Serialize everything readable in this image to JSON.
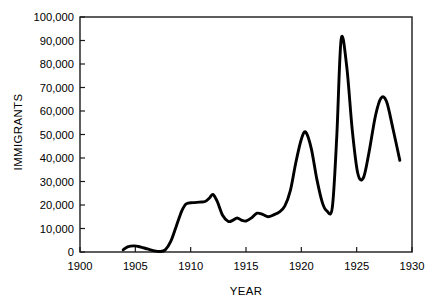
{
  "chart_data": {
    "type": "line",
    "title": "",
    "xlabel": "YEAR",
    "ylabel": "IMMIGRANTS",
    "xlim": [
      1900,
      1930
    ],
    "ylim": [
      0,
      100000
    ],
    "grid": false,
    "legend": "none",
    "x_ticks": [
      1900,
      1905,
      1910,
      1915,
      1920,
      1925,
      1930
    ],
    "x_tick_labels": [
      "1900",
      "1905",
      "1910",
      "1915",
      "1920",
      "1925",
      "1930"
    ],
    "y_ticks": [
      0,
      10000,
      20000,
      30000,
      40000,
      50000,
      60000,
      70000,
      80000,
      90000,
      100000
    ],
    "y_tick_labels": [
      "0",
      "10,000",
      "20,000",
      "30,000",
      "40,000",
      "50,000",
      "60,000",
      "70,000",
      "80,000",
      "90,000",
      "100,000"
    ],
    "series": [
      {
        "name": "Immigrants",
        "color": "#000000",
        "x": [
          1903.9,
          1904.3,
          1904.9,
          1905.5,
          1906.1,
          1906.7,
          1907.2,
          1907.7,
          1908.2,
          1908.7,
          1909.2,
          1909.6,
          1910.2,
          1910.8,
          1911.3,
          1911.7,
          1912.0,
          1912.4,
          1912.9,
          1913.4,
          1913.8,
          1914.2,
          1914.6,
          1915.0,
          1915.5,
          1916.0,
          1916.5,
          1917.0,
          1917.5,
          1918.0,
          1918.5,
          1919.0,
          1919.5,
          1920.0,
          1920.4,
          1920.9,
          1921.4,
          1921.9,
          1922.3,
          1922.8,
          1923.2,
          1923.6,
          1924.1,
          1924.6,
          1925.1,
          1925.6,
          1926.1,
          1926.7,
          1927.2,
          1927.7,
          1928.3,
          1928.9
        ],
        "y": [
          900,
          2200,
          2600,
          2100,
          1300,
          500,
          200,
          900,
          4500,
          11000,
          17500,
          20500,
          21000,
          21200,
          21500,
          23000,
          24500,
          21500,
          15500,
          13000,
          13500,
          14500,
          13500,
          13200,
          14500,
          16500,
          16000,
          15000,
          15800,
          17000,
          19500,
          26000,
          38000,
          48000,
          51000,
          44000,
          31000,
          21000,
          17500,
          19000,
          49000,
          90500,
          79000,
          52000,
          33500,
          31500,
          42000,
          58000,
          65500,
          64000,
          52000,
          39000
        ]
      }
    ],
    "annotations": []
  }
}
